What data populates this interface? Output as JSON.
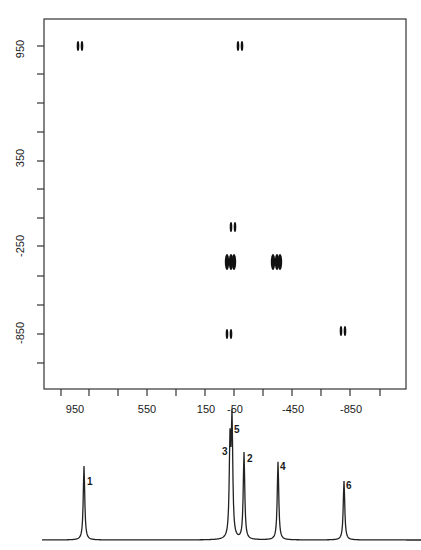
{
  "chart_data": [
    {
      "type": "contour",
      "title": "",
      "xlabel": "",
      "ylabel": "",
      "xlim": [
        1250,
        -1150
      ],
      "ylim": [
        -1150,
        1250
      ],
      "x_ticks": [
        950,
        550,
        150,
        -50,
        -450,
        -850
      ],
      "x_tick_labels": [
        "950",
        "550",
        "150",
        "-50",
        "-450",
        "-850"
      ],
      "y_ticks": [
        950,
        350,
        -250,
        -850
      ],
      "y_tick_labels": [
        "950",
        "350",
        "-250",
        "-850"
      ],
      "grid": false,
      "cross_peaks": [
        {
          "x": 1050,
          "y": 1020
        },
        {
          "x": 0,
          "y": 1020
        },
        {
          "x": -30,
          "y": -230
        },
        {
          "x": 20,
          "y": -390
        },
        {
          "x": -350,
          "y": -390
        },
        {
          "x": 20,
          "y": -850
        },
        {
          "x": -880,
          "y": -850
        }
      ]
    },
    {
      "type": "line",
      "title": "1D spectrum",
      "peaks": [
        {
          "label": "1",
          "x": 1050,
          "rel_height": 0.63
        },
        {
          "label": "3",
          "x": 20,
          "rel_height": 0.8
        },
        {
          "label": "5",
          "x": 0,
          "rel_height": 1.0
        },
        {
          "label": "2",
          "x": -40,
          "rel_height": 0.76
        },
        {
          "label": "4",
          "x": -350,
          "rel_height": 0.67
        },
        {
          "label": "6",
          "x": -880,
          "rel_height": 0.5
        }
      ]
    }
  ],
  "axes": {
    "y_labels": [
      "950",
      "350",
      "-250",
      "-850"
    ],
    "x_labels": [
      "950",
      "550",
      "150",
      "-50",
      "-450",
      "-850"
    ]
  },
  "peak_labels": [
    "1",
    "3",
    "5",
    "2",
    "4",
    "6"
  ]
}
